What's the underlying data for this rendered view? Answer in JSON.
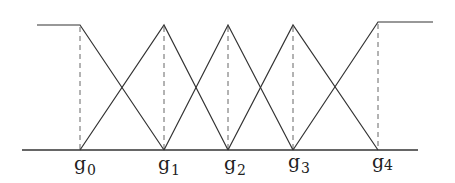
{
  "diagram": {
    "type": "fuzzy-membership-functions",
    "colors": {
      "line": "#333333",
      "dashed": "#666666",
      "background": "#ffffff"
    },
    "axis": {
      "y": 150,
      "x_start": 22,
      "x_end": 418
    },
    "top_y": 25,
    "left_plateau": {
      "x_start": 37,
      "x_end": 80,
      "y": 25
    },
    "right_plateau": {
      "x_start": 378,
      "x_end": 433,
      "y": 22
    },
    "points": [
      {
        "name": "g",
        "sub": "0",
        "x": 80
      },
      {
        "name": "g",
        "sub": "1",
        "x": 164
      },
      {
        "name": "g",
        "sub": "2",
        "x": 228
      },
      {
        "name": "g",
        "sub": "3",
        "x": 293
      },
      {
        "name": "g",
        "sub": "4",
        "x": 378
      }
    ],
    "labels": {
      "g0": "g",
      "g0_sub": "0",
      "g1": "g",
      "g1_sub": "1",
      "g2": "g",
      "g2_sub": "2",
      "g3": "g",
      "g3_sub": "3",
      "g4": "g",
      "g4_sub": "4"
    }
  }
}
